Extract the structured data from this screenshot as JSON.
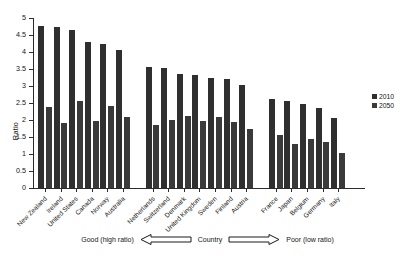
{
  "chart_data": {
    "type": "bar",
    "title": "",
    "xlabel": "Country",
    "ylabel": "Ratio",
    "ylim": [
      0,
      5
    ],
    "ytick_values": [
      "5",
      "4.5",
      "4",
      "3.5",
      "3",
      "2.5",
      "2",
      "1.5",
      "1",
      "0.5",
      "0"
    ],
    "grid": false,
    "legend_position": "right",
    "categories": [
      "New Zealand",
      "Ireland",
      "United States",
      "Canada",
      "Norway",
      "Australia",
      "Netherlands",
      "Switzerland",
      "Denmark",
      "United Kingdom",
      "Sweden",
      "Finland",
      "Austria",
      "France",
      "Japan",
      "Belgium",
      "Germany",
      "Italy"
    ],
    "groups": [
      {
        "name": "group-1",
        "categories": [
          "New Zealand",
          "Ireland",
          "United States",
          "Canada",
          "Norway",
          "Australia"
        ]
      },
      {
        "name": "group-2",
        "categories": [
          "Netherlands",
          "Switzerland",
          "Denmark",
          "United Kingdom",
          "Sweden",
          "Finland",
          "Austria"
        ]
      },
      {
        "name": "group-3",
        "categories": [
          "France",
          "Japan",
          "Belgium",
          "Germany",
          "Italy"
        ]
      }
    ],
    "series": [
      {
        "name": "2010",
        "color": "#2f2f2f",
        "values": [
          4.76,
          4.73,
          4.64,
          4.29,
          4.23,
          4.06,
          3.55,
          3.52,
          3.34,
          3.31,
          3.25,
          3.22,
          3.03,
          2.62,
          2.56,
          2.47,
          2.35,
          2.06
        ]
      },
      {
        "name": "2050",
        "color": "#3a3a3a",
        "values": [
          2.38,
          1.91,
          2.56,
          1.97,
          2.4,
          2.09,
          1.85,
          2.0,
          2.12,
          1.96,
          2.09,
          1.94,
          1.74,
          1.56,
          1.29,
          1.43,
          1.36,
          1.03
        ]
      }
    ],
    "annotation": {
      "left_label": "Good (high ratio)",
      "center_label": "Country",
      "right_label": "Poor (low ratio)",
      "left_arrow": "left-arrow-icon",
      "right_arrow": "right-arrow-icon"
    }
  }
}
